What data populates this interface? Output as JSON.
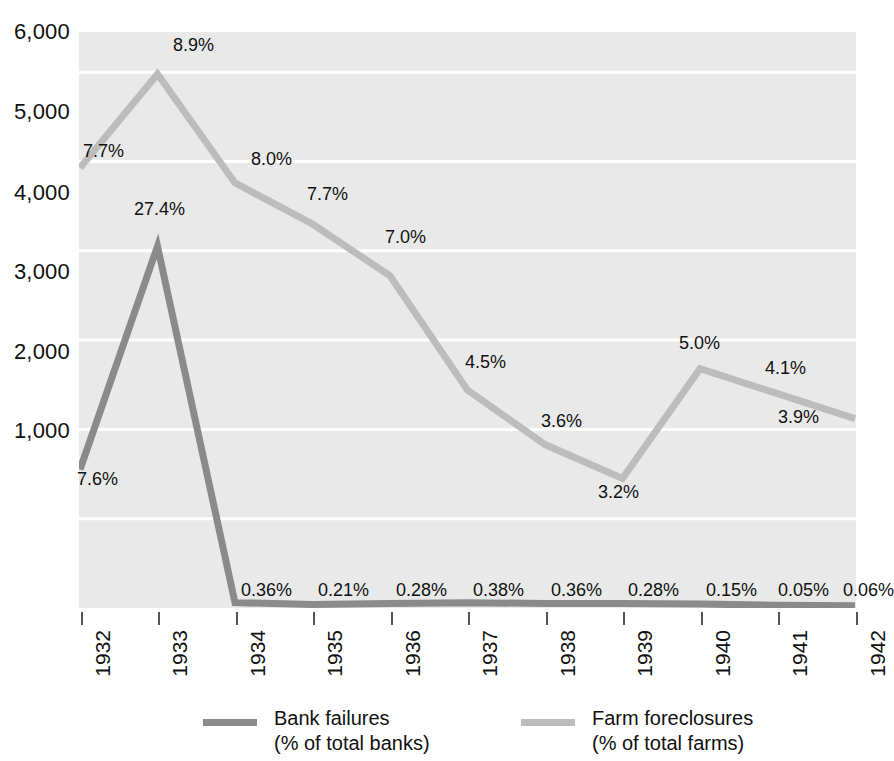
{
  "chart_data": {
    "type": "line",
    "title": "",
    "subtitle": "",
    "xlabel": "",
    "ylabel": "",
    "grid": true,
    "legend_position": "bottom",
    "x": [
      "1932",
      "1933",
      "1934",
      "1935",
      "1936",
      "1937",
      "1938",
      "1939",
      "1940",
      "1941",
      "1942"
    ],
    "categories": [
      "1932",
      "1933",
      "1934",
      "1935",
      "1936",
      "1937",
      "1938",
      "1939",
      "1940",
      "1941",
      "1942"
    ],
    "ylim": [
      0,
      6450
    ],
    "yticks": [
      1000,
      2000,
      3000,
      4000,
      5000,
      6000
    ],
    "ytick_labels": [
      "1,000",
      "2,000",
      "3,000",
      "4,000",
      "5,000",
      "6,000"
    ],
    "series": [
      {
        "name": "Bank failures",
        "sublabel": "(% of total banks)",
        "color": "#8a8a8a",
        "values": [
          1550,
          4050,
          60,
          40,
          50,
          60,
          50,
          50,
          45,
          30,
          25
        ],
        "point_labels": [
          "7.6%",
          "27.4%",
          "0.36%",
          "0.21%",
          "0.28%",
          "0.38%",
          "0.36%",
          "0.28%",
          "0.15%",
          "0.05%",
          "0.06%"
        ]
      },
      {
        "name": "Farm foreclosures",
        "sublabel": "(% of total farms)",
        "color": "#bcbcbc",
        "values": [
          4930,
          5980,
          4760,
          4300,
          3720,
          2440,
          1830,
          1450,
          2680,
          2400,
          2120
        ],
        "point_labels": [
          "7.7%",
          "8.9%",
          "8.0%",
          "7.7%",
          "7.0%",
          "4.5%",
          "3.6%",
          "3.2%",
          "5.0%",
          "4.1%",
          "3.9%"
        ]
      }
    ]
  },
  "y_axis": {
    "labels": [
      {
        "text": "6,000",
        "y": 21
      },
      {
        "text": "5,000",
        "y": 101
      },
      {
        "text": "4,000",
        "y": 182
      },
      {
        "text": "3,000",
        "y": 261
      },
      {
        "text": "2,000",
        "y": 341
      },
      {
        "text": "1,000",
        "y": 420
      }
    ]
  },
  "x_axis": {
    "labels": [
      {
        "text": "1932",
        "x": 81
      },
      {
        "text": "1933",
        "x": 158
      },
      {
        "text": "1934",
        "x": 236
      },
      {
        "text": "1935",
        "x": 313
      },
      {
        "text": "1936",
        "x": 391
      },
      {
        "text": "1937",
        "x": 468
      },
      {
        "text": "1938",
        "x": 546
      },
      {
        "text": "1939",
        "x": 623
      },
      {
        "text": "1940",
        "x": 701
      },
      {
        "text": "1941",
        "x": 778
      },
      {
        "text": "1942",
        "x": 856
      }
    ]
  },
  "data_labels": [
    {
      "text": "7.7%",
      "x": 83,
      "y": 142,
      "series": "farm"
    },
    {
      "text": "8.9%",
      "x": 173,
      "y": 36,
      "series": "farm"
    },
    {
      "text": "8.0%",
      "x": 251,
      "y": 150,
      "series": "farm"
    },
    {
      "text": "7.7%",
      "x": 307,
      "y": 185,
      "series": "farm"
    },
    {
      "text": "7.0%",
      "x": 385,
      "y": 228,
      "series": "farm"
    },
    {
      "text": "4.5%",
      "x": 465,
      "y": 353,
      "series": "farm"
    },
    {
      "text": "3.6%",
      "x": 541,
      "y": 412,
      "series": "farm"
    },
    {
      "text": "3.2%",
      "x": 598,
      "y": 483,
      "series": "farm"
    },
    {
      "text": "5.0%",
      "x": 679,
      "y": 334,
      "series": "farm"
    },
    {
      "text": "4.1%",
      "x": 765,
      "y": 359,
      "series": "farm"
    },
    {
      "text": "3.9%",
      "x": 778,
      "y": 408,
      "series": "farm"
    },
    {
      "text": "7.6%",
      "x": 77,
      "y": 470,
      "series": "bank"
    },
    {
      "text": "27.4%",
      "x": 134,
      "y": 200,
      "series": "bank"
    },
    {
      "text": "0.36%",
      "x": 241,
      "y": 581,
      "series": "bank"
    },
    {
      "text": "0.21%",
      "x": 318,
      "y": 581,
      "series": "bank"
    },
    {
      "text": "0.28%",
      "x": 396,
      "y": 581,
      "series": "bank"
    },
    {
      "text": "0.38%",
      "x": 473,
      "y": 581,
      "series": "bank"
    },
    {
      "text": "0.36%",
      "x": 551,
      "y": 581,
      "series": "bank"
    },
    {
      "text": "0.28%",
      "x": 628,
      "y": 581,
      "series": "bank"
    },
    {
      "text": "0.15%",
      "x": 706,
      "y": 581,
      "series": "bank"
    },
    {
      "text": "0.05%",
      "x": 778,
      "y": 581,
      "series": "bank"
    },
    {
      "text": "0.06%",
      "x": 843,
      "y": 581,
      "series": "bank"
    }
  ],
  "legend": {
    "entries": [
      {
        "name": "Bank failures",
        "line1": "Bank failures",
        "line2": "(% of total banks)",
        "color": "#8a8a8a",
        "x": 203
      },
      {
        "name": "Farm foreclosures",
        "line1": "Farm foreclosures",
        "line2": "(% of total farms)",
        "color": "#bcbcbc",
        "x": 521
      }
    ]
  }
}
